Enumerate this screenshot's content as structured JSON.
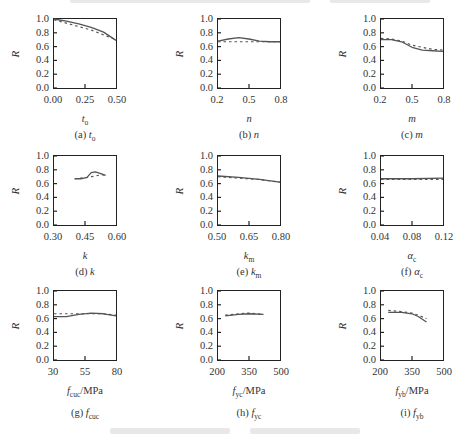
{
  "chart_data": [
    {
      "id": "a",
      "type": "line",
      "caption": "(a) t_o",
      "xlabel": "t_o",
      "ylabel": "R",
      "xlim": [
        0.0,
        0.5
      ],
      "ylim": [
        0.0,
        1.0
      ],
      "xticks": [
        "0.00",
        "0.25",
        "0.50"
      ],
      "yticks": [
        "0.0",
        "0.2",
        "0.4",
        "0.6",
        "0.8",
        "1.0"
      ],
      "series": [
        {
          "name": "solid",
          "style": "solid",
          "x": [
            0.0,
            0.1,
            0.2,
            0.3,
            0.4,
            0.5
          ],
          "y": [
            1.0,
            0.97,
            0.93,
            0.88,
            0.81,
            0.69
          ]
        },
        {
          "name": "dashed",
          "style": "dashed",
          "x": [
            0.0,
            0.1,
            0.2,
            0.3,
            0.4,
            0.5
          ],
          "y": [
            0.99,
            0.94,
            0.89,
            0.84,
            0.77,
            0.7
          ]
        }
      ]
    },
    {
      "id": "b",
      "type": "line",
      "caption": "(b) n",
      "xlabel": "n",
      "ylabel": "R",
      "xlim": [
        0.2,
        0.8
      ],
      "ylim": [
        0.0,
        1.0
      ],
      "xticks": [
        "0.2",
        "0.5",
        "0.8"
      ],
      "yticks": [
        "0.0",
        "0.2",
        "0.4",
        "0.6",
        "0.8",
        "1.0"
      ],
      "series": [
        {
          "name": "solid",
          "style": "solid",
          "x": [
            0.2,
            0.3,
            0.4,
            0.5,
            0.6,
            0.7,
            0.8
          ],
          "y": [
            0.68,
            0.71,
            0.73,
            0.71,
            0.68,
            0.67,
            0.67
          ]
        },
        {
          "name": "dashed",
          "style": "dashed",
          "x": [
            0.2,
            0.3,
            0.4,
            0.5,
            0.6,
            0.7,
            0.8
          ],
          "y": [
            0.67,
            0.67,
            0.67,
            0.67,
            0.67,
            0.67,
            0.67
          ]
        }
      ]
    },
    {
      "id": "c",
      "type": "line",
      "caption": "(c) m",
      "xlabel": "m",
      "ylabel": "R",
      "xlim": [
        0.2,
        0.8
      ],
      "ylim": [
        0.0,
        1.0
      ],
      "xticks": [
        "0.2",
        "0.5",
        "0.8"
      ],
      "yticks": [
        "0.0",
        "0.2",
        "0.4",
        "0.6",
        "0.8",
        "1.0"
      ],
      "series": [
        {
          "name": "solid",
          "style": "solid",
          "x": [
            0.2,
            0.3,
            0.4,
            0.5,
            0.6,
            0.7,
            0.8
          ],
          "y": [
            0.7,
            0.7,
            0.67,
            0.59,
            0.55,
            0.54,
            0.53
          ]
        },
        {
          "name": "dashed",
          "style": "dashed",
          "x": [
            0.2,
            0.3,
            0.4,
            0.5,
            0.6,
            0.7,
            0.8
          ],
          "y": [
            0.72,
            0.71,
            0.68,
            0.62,
            0.59,
            0.56,
            0.55
          ]
        }
      ]
    },
    {
      "id": "d",
      "type": "line",
      "caption": "(d) k",
      "xlabel": "k",
      "ylabel": "R",
      "xlim": [
        0.3,
        0.6
      ],
      "ylim": [
        0.0,
        1.0
      ],
      "xticks": [
        "0.30",
        "0.45",
        "0.60"
      ],
      "yticks": [
        "0.0",
        "0.2",
        "0.4",
        "0.6",
        "0.8",
        "1.0"
      ],
      "series": [
        {
          "name": "solid",
          "style": "solid",
          "x": [
            0.4,
            0.43,
            0.46,
            0.48,
            0.5,
            0.53,
            0.55
          ],
          "y": [
            0.67,
            0.67,
            0.69,
            0.76,
            0.77,
            0.74,
            0.72
          ]
        },
        {
          "name": "dashed",
          "style": "dashed",
          "x": [
            0.4,
            0.43,
            0.46,
            0.48,
            0.5,
            0.53,
            0.55
          ],
          "y": [
            0.67,
            0.68,
            0.69,
            0.7,
            0.71,
            0.73,
            0.72
          ]
        }
      ]
    },
    {
      "id": "e",
      "type": "line",
      "caption": "(e) k_m",
      "xlabel": "k_m",
      "ylabel": "R",
      "xlim": [
        0.5,
        0.8
      ],
      "ylim": [
        0.0,
        1.0
      ],
      "xticks": [
        "0.50",
        "0.65",
        "0.80"
      ],
      "yticks": [
        "0.0",
        "0.2",
        "0.4",
        "0.6",
        "0.8",
        "1.0"
      ],
      "series": [
        {
          "name": "solid",
          "style": "solid",
          "x": [
            0.5,
            0.6,
            0.7,
            0.8
          ],
          "y": [
            0.71,
            0.69,
            0.66,
            0.62
          ]
        },
        {
          "name": "dashed",
          "style": "dashed",
          "x": [
            0.5,
            0.6,
            0.7,
            0.8
          ],
          "y": [
            0.7,
            0.68,
            0.66,
            0.62
          ]
        }
      ]
    },
    {
      "id": "f",
      "type": "line",
      "caption": "(f) α_c",
      "xlabel": "α_c",
      "ylabel": "R",
      "xlim": [
        0.04,
        0.12
      ],
      "ylim": [
        0.0,
        1.0
      ],
      "xticks": [
        "0.04",
        "0.08",
        "0.12"
      ],
      "yticks": [
        "0.0",
        "0.2",
        "0.4",
        "0.6",
        "0.8",
        "1.0"
      ],
      "series": [
        {
          "name": "solid",
          "style": "solid",
          "x": [
            0.04,
            0.08,
            0.12
          ],
          "y": [
            0.67,
            0.67,
            0.68
          ]
        },
        {
          "name": "dashed",
          "style": "dashed",
          "x": [
            0.04,
            0.08,
            0.12
          ],
          "y": [
            0.66,
            0.66,
            0.66
          ]
        }
      ]
    },
    {
      "id": "g",
      "type": "line",
      "caption": "(g) f_cuc",
      "xlabel": "f_cuc/MPa",
      "ylabel": "R",
      "xlim": [
        30,
        80
      ],
      "ylim": [
        0.0,
        1.0
      ],
      "xticks": [
        "30",
        "55",
        "80"
      ],
      "yticks": [
        "0.0",
        "0.2",
        "0.4",
        "0.6",
        "0.8",
        "1.0"
      ],
      "series": [
        {
          "name": "solid",
          "style": "solid",
          "x": [
            30,
            40,
            50,
            60,
            70,
            80
          ],
          "y": [
            0.63,
            0.63,
            0.66,
            0.68,
            0.67,
            0.64
          ]
        },
        {
          "name": "dashed",
          "style": "dashed",
          "x": [
            30,
            40,
            50,
            60,
            70,
            80
          ],
          "y": [
            0.67,
            0.67,
            0.67,
            0.67,
            0.67,
            0.65
          ]
        }
      ]
    },
    {
      "id": "h",
      "type": "line",
      "caption": "(h) f_yc",
      "xlabel": "f_yc/MPa",
      "ylabel": "R",
      "xlim": [
        200,
        500
      ],
      "ylim": [
        0.0,
        1.0
      ],
      "xticks": [
        "200",
        "350",
        "500"
      ],
      "yticks": [
        "0.0",
        "0.2",
        "0.4",
        "0.6",
        "0.8",
        "1.0"
      ],
      "series": [
        {
          "name": "solid",
          "style": "solid",
          "x": [
            235,
            300,
            350,
            420
          ],
          "y": [
            0.64,
            0.66,
            0.67,
            0.66
          ]
        },
        {
          "name": "dashed",
          "style": "dashed",
          "x": [
            235,
            300,
            350,
            420
          ],
          "y": [
            0.65,
            0.67,
            0.68,
            0.66
          ]
        }
      ]
    },
    {
      "id": "i",
      "type": "line",
      "caption": "(i) f_yb",
      "xlabel": "f_yb/MPa",
      "ylabel": "R",
      "xlim": [
        200,
        500
      ],
      "ylim": [
        0.0,
        1.0
      ],
      "xticks": [
        "200",
        "350",
        "500"
      ],
      "yticks": [
        "0.0",
        "0.2",
        "0.4",
        "0.6",
        "0.8",
        "1.0"
      ],
      "series": [
        {
          "name": "solid",
          "style": "solid",
          "x": [
            235,
            300,
            350,
            380,
            420
          ],
          "y": [
            0.69,
            0.69,
            0.67,
            0.63,
            0.55
          ]
        },
        {
          "name": "dashed",
          "style": "dashed",
          "x": [
            235,
            300,
            350,
            380,
            420
          ],
          "y": [
            0.72,
            0.7,
            0.68,
            0.65,
            0.6
          ]
        }
      ]
    }
  ],
  "panels": [
    {
      "caption_prefix": "(a) ",
      "caption_var": "t",
      "caption_sub": "o",
      "xlabel_var": "t",
      "xlabel_sub": "o",
      "xlabel_unit": ""
    },
    {
      "caption_prefix": "(b) ",
      "caption_var": "n",
      "caption_sub": "",
      "xlabel_var": "n",
      "xlabel_sub": "",
      "xlabel_unit": ""
    },
    {
      "caption_prefix": "(c) ",
      "caption_var": "m",
      "caption_sub": "",
      "xlabel_var": "m",
      "xlabel_sub": "",
      "xlabel_unit": ""
    },
    {
      "caption_prefix": "(d) ",
      "caption_var": "k",
      "caption_sub": "",
      "xlabel_var": "k",
      "xlabel_sub": "",
      "xlabel_unit": ""
    },
    {
      "caption_prefix": "(e) ",
      "caption_var": "k",
      "caption_sub": "m",
      "xlabel_var": "k",
      "xlabel_sub": "m",
      "xlabel_unit": ""
    },
    {
      "caption_prefix": "(f) ",
      "caption_var": "α",
      "caption_sub": "c",
      "xlabel_var": "α",
      "xlabel_sub": "c",
      "xlabel_unit": ""
    },
    {
      "caption_prefix": "(g) ",
      "caption_var": "f",
      "caption_sub": "cuc",
      "xlabel_var": "f",
      "xlabel_sub": "cuc",
      "xlabel_unit": "/MPa"
    },
    {
      "caption_prefix": "(h) ",
      "caption_var": "f",
      "caption_sub": "yc",
      "xlabel_var": "f",
      "xlabel_sub": "yc",
      "xlabel_unit": "/MPa"
    },
    {
      "caption_prefix": "(i) ",
      "caption_var": "f",
      "caption_sub": "yb",
      "xlabel_var": "f",
      "xlabel_sub": "yb",
      "xlabel_unit": "/MPa"
    }
  ],
  "colors": {
    "solid": "#555555",
    "dashed": "#555555",
    "axis": "#222222",
    "text": "#333333"
  }
}
